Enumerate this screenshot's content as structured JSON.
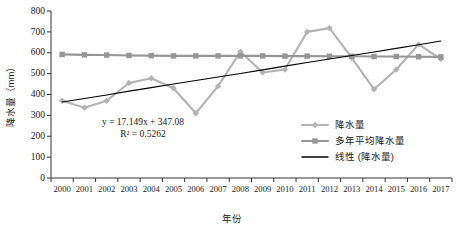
{
  "chart_data": {
    "type": "line",
    "title": "",
    "xlabel": "年份",
    "ylabel": "降水量（mm）",
    "categories": [
      "2000",
      "2001",
      "2002",
      "2003",
      "2004",
      "2005",
      "2006",
      "2007",
      "2008",
      "2009",
      "2010",
      "2011",
      "2012",
      "2013",
      "2014",
      "2015",
      "2016",
      "2017"
    ],
    "x": [
      2000,
      2001,
      2002,
      2003,
      2004,
      2005,
      2006,
      2007,
      2008,
      2009,
      2010,
      2011,
      2012,
      2013,
      2014,
      2015,
      2016,
      2017
    ],
    "ylim": [
      0,
      800
    ],
    "yticks": [
      0,
      100,
      200,
      300,
      400,
      500,
      600,
      700,
      800
    ],
    "grid": false,
    "legend_position": "right-inside-bottom",
    "series": [
      {
        "name": "降水量",
        "type": "line-marker",
        "color": "#b3b3b3",
        "marker": "diamond",
        "values": [
          370,
          337,
          370,
          455,
          478,
          430,
          310,
          440,
          605,
          505,
          520,
          700,
          718,
          575,
          425,
          520,
          640,
          570
        ]
      },
      {
        "name": "多年平均降水量",
        "type": "line-marker",
        "color": "#969696",
        "marker": "square",
        "values": [
          592,
          590,
          589,
          587,
          586,
          585,
          585,
          585,
          585,
          585,
          584,
          584,
          583,
          583,
          582,
          582,
          581,
          580
        ]
      },
      {
        "name": "线性 (降水量)",
        "type": "trendline",
        "color": "#000000",
        "marker": "none",
        "values": [
          364,
          381,
          398,
          416,
          433,
          450,
          467,
          484,
          501,
          518,
          536,
          553,
          570,
          587,
          604,
          621,
          638,
          656
        ]
      }
    ],
    "annotations": [
      {
        "name": "trendline-equation",
        "text": "y = 17.149x + 347.08"
      },
      {
        "name": "trendline-r2",
        "text": "R² = 0.5262"
      }
    ],
    "legend": [
      {
        "label": "降水量",
        "color": "#b3b3b3",
        "marker": "diamond"
      },
      {
        "label": "多年平均降水量",
        "color": "#969696",
        "marker": "square"
      },
      {
        "label": "线性 (降水量)",
        "color": "#000000",
        "marker": "none"
      }
    ]
  }
}
